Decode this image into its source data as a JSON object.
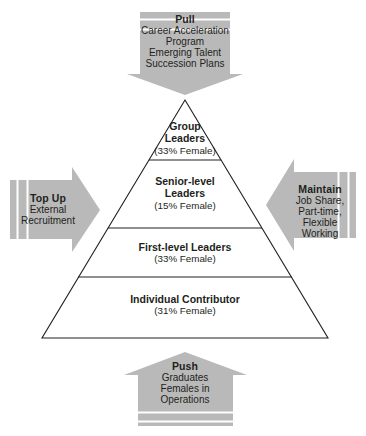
{
  "diagram": {
    "type": "pyramid-with-arrows",
    "background_color": "#ffffff",
    "line_color": "#231f20",
    "arrow_fill": "#b9b9b9",
    "text_color": "#231f20"
  },
  "pyramid": {
    "name": "leadership-pipeline-pyramid",
    "tiers": [
      {
        "title": "Group",
        "title2": "Leaders",
        "sub": "(33% Female)",
        "percent_female": 33,
        "level": 4
      },
      {
        "title": "Senior-level",
        "title2": "Leaders",
        "sub": "(15% Female)",
        "percent_female": 15,
        "level": 3
      },
      {
        "title": "First-level Leaders",
        "title2": "",
        "sub": "(33% Female)",
        "percent_female": 33,
        "level": 2
      },
      {
        "title": "Individual Contributor",
        "title2": "",
        "sub": "(31% Female)",
        "percent_female": 31,
        "level": 1
      }
    ]
  },
  "arrows": {
    "top": {
      "name": "pull-arrow",
      "direction": "down",
      "title": "Pull",
      "lines": [
        "Career Acceleration",
        "Program",
        "Emerging Talent",
        "Succession Plans"
      ]
    },
    "left": {
      "name": "top-up-arrow",
      "direction": "right",
      "title": "Top Up",
      "lines": [
        "External",
        "Recruitment"
      ]
    },
    "right": {
      "name": "maintain-arrow",
      "direction": "left",
      "title": "Maintain",
      "lines": [
        "Job Share,",
        "Part-time,",
        "Flexible",
        "Working"
      ]
    },
    "bottom": {
      "name": "push-arrow",
      "direction": "up",
      "title": "Push",
      "lines": [
        "Graduates",
        "Females in",
        "Operations"
      ]
    }
  }
}
